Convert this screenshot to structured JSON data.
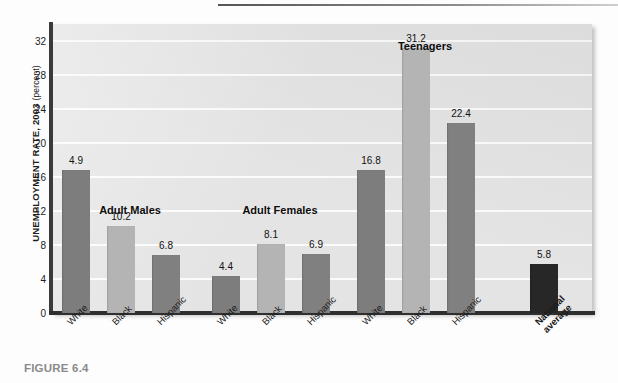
{
  "figure": {
    "caption": "FIGURE 6.4"
  },
  "chart_data": {
    "type": "bar",
    "title": "",
    "xlabel": "",
    "ylabel": "UNEMPLOYMENT RATE, 2003",
    "ylabel_unit": "(percent)",
    "ylim": [
      0,
      34
    ],
    "yticks": [
      0,
      4,
      8,
      12,
      16,
      20,
      24,
      28,
      32
    ],
    "ytick_labels": [
      "0",
      "4",
      "8",
      "12",
      "16",
      "20",
      "24",
      "28",
      "32"
    ],
    "grid": true,
    "legend": "none",
    "categories": [
      "White",
      "Black",
      "Hispanic"
    ],
    "groups": [
      {
        "name": "Adult Males",
        "bars": [
          {
            "label": "White",
            "value": 16.8,
            "value_label": "4.9",
            "shade": "#7d7d7d"
          },
          {
            "label": "Black",
            "value": 10.2,
            "value_label": "10.2",
            "shade": "#b4b4b4"
          },
          {
            "label": "Hispanic",
            "value": 6.8,
            "value_label": "6.8",
            "shade": "#808080"
          }
        ]
      },
      {
        "name": "Adult Females",
        "bars": [
          {
            "label": "White",
            "value": 4.4,
            "value_label": "4.4",
            "shade": "#7d7d7d"
          },
          {
            "label": "Black",
            "value": 8.1,
            "value_label": "8.1",
            "shade": "#b4b4b4"
          },
          {
            "label": "Hispanic",
            "value": 6.9,
            "value_label": "6.9",
            "shade": "#808080"
          }
        ]
      },
      {
        "name": "Teenagers",
        "bars": [
          {
            "label": "White",
            "value": 16.8,
            "value_label": "16.8",
            "shade": "#7d7d7d"
          },
          {
            "label": "Black",
            "value": 31.2,
            "value_label": "31.2",
            "shade": "#b4b4b4"
          },
          {
            "label": "Hispanic",
            "value": 22.4,
            "value_label": "22.4",
            "shade": "#808080"
          }
        ]
      },
      {
        "name": "",
        "bars": [
          {
            "label": "National\naverage",
            "value": 5.8,
            "value_label": "5.8",
            "shade": "#272727",
            "bold_label": true
          }
        ]
      }
    ],
    "values_flat": [
      4.9,
      10.2,
      6.8,
      4.4,
      8.1,
      6.9,
      16.8,
      31.2,
      22.4,
      5.8
    ],
    "annotations": [
      "Adult Males",
      "Adult Females",
      "Teenagers"
    ]
  },
  "colors": {
    "plot_background": "#e4e4e4",
    "gridline": "#fbfbfb",
    "axis": "#2f2f2f",
    "bar_white": "#7d7d7d",
    "bar_black": "#b4b4b4",
    "bar_hispanic": "#808080",
    "bar_national": "#272727",
    "caption": "#8a8a8a"
  }
}
